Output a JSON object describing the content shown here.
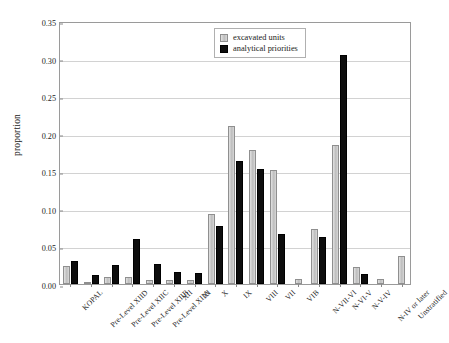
{
  "chart_data": {
    "type": "bar",
    "title": "",
    "xlabel": "",
    "ylabel": "proportion",
    "ylim": [
      0.0,
      0.35
    ],
    "ytick_values": [
      0.35,
      0.3,
      0.25,
      0.2,
      0.15,
      0.1,
      0.05,
      0.0
    ],
    "ytick_labels": [
      "0.35",
      "0.30",
      "0.25",
      "0.20",
      "0.15",
      "0.10",
      "0.05",
      "0.00"
    ],
    "grid": true,
    "legend_position": "top-right",
    "categories": [
      "KOPAL",
      "Pre-Level XIID",
      "Pre-Level XIIC",
      "Pre-Level XIIB",
      "Pre-Level XIIA",
      "XII",
      "XI",
      "X",
      "IX",
      "VIII",
      "VII",
      "VIB",
      "N-VII-VI",
      "N-VI-V",
      "N-V-IV",
      "N-IV or later",
      "Unstratified"
    ],
    "series": [
      {
        "name": "excavated units",
        "color": "#cccccc",
        "values": [
          0.024,
          0.003,
          0.01,
          0.01,
          0.006,
          0.006,
          0.005,
          0.093,
          0.21,
          0.178,
          0.152,
          0.007,
          0.073,
          0.185,
          0.022,
          0.007,
          0.037
        ]
      },
      {
        "name": "analytical priorities",
        "color": "#000000",
        "values": [
          0.03,
          0.012,
          0.025,
          0.06,
          0.026,
          0.016,
          0.015,
          0.077,
          0.164,
          0.153,
          0.066,
          0.0,
          0.062,
          0.305,
          0.013,
          0.0,
          0.0
        ]
      }
    ]
  },
  "legend": {
    "items": [
      {
        "label": "excavated units"
      },
      {
        "label": "analytical priorities"
      }
    ]
  }
}
